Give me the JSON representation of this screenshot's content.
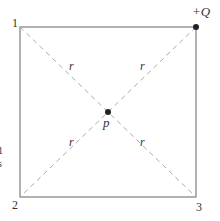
{
  "diagram": {
    "corners": [
      {
        "label": "1",
        "x": 20,
        "y": 27
      },
      {
        "label": "+Q",
        "x": 196,
        "y": 27
      },
      {
        "label": "3",
        "x": 196,
        "y": 197
      },
      {
        "label": "2",
        "x": 20,
        "y": 197
      }
    ],
    "corner_labels": {
      "c1": "1",
      "c2": "2",
      "c3": "3",
      "charge": "+Q"
    },
    "center_label": "p",
    "distance_label": "r",
    "clipped_margin_text": {
      "a": "1",
      "b": "s"
    },
    "colors": {
      "square": "#888888",
      "diagonal": "#aaaaaa",
      "dot": "#222222",
      "text": "#333333"
    }
  }
}
